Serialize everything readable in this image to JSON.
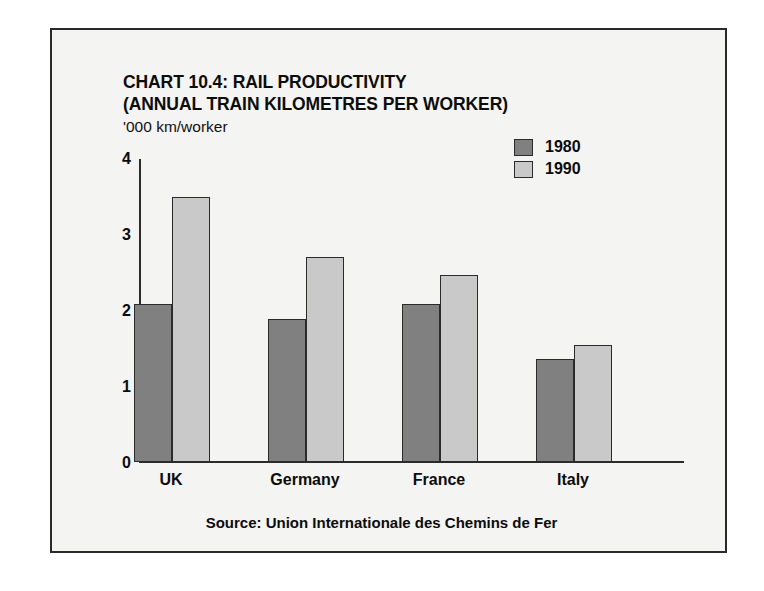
{
  "chart_data": {
    "type": "bar",
    "title": "CHART 10.4: RAIL PRODUCTIVITY\n(ANNUAL TRAIN KILOMETRES PER WORKER)",
    "title_line1": "CHART 10.4: RAIL PRODUCTIVITY",
    "title_line2": "(ANNUAL TRAIN KILOMETRES PER WORKER)",
    "ylabel": "'000 km/worker",
    "xlabel": "",
    "categories": [
      "UK",
      "Germany",
      "France",
      "Italy"
    ],
    "series": [
      {
        "name": "1980",
        "color": "#808080",
        "values": [
          2.08,
          1.88,
          2.08,
          1.36
        ]
      },
      {
        "name": "1990",
        "color": "#c9c9c9",
        "values": [
          3.5,
          2.7,
          2.47,
          1.55
        ]
      }
    ],
    "ylim": [
      0,
      4
    ],
    "yticks": [
      0,
      1,
      2,
      3,
      4
    ],
    "ytick_labels": [
      "0",
      "1",
      "2",
      "3",
      "4"
    ],
    "grid": false,
    "legend_position": "top-right",
    "source": "Source: Union Internationale des Chemins de Fer"
  }
}
